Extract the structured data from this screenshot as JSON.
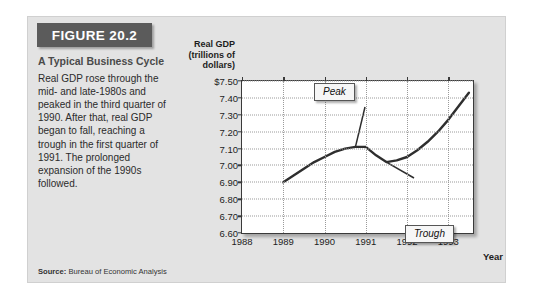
{
  "figure": {
    "header_label": "FIGURE 20.2",
    "caption_title": "A Typical Business Cycle",
    "caption_body": "Real GDP rose through the mid- and late-1980s and peaked in the third quarter of 1990. After that, real GDP began to fall, reaching a trough in the first quarter of 1991. The prolonged expansion of the 1990s followed.",
    "source_label": "Source:",
    "source_text": " Bureau of Economic Analysis"
  },
  "chart_data": {
    "type": "line",
    "title": "",
    "ylabel": "Real GDP (trillions of dollars)",
    "ylabel_lines": [
      "Real GDP",
      "(trillions of",
      "dollars)"
    ],
    "xlabel": "Year",
    "ylim": [
      6.6,
      7.5
    ],
    "xlim": [
      1988,
      1993.6
    ],
    "grid": true,
    "legend": "none",
    "ytick_labels": [
      "$7.50",
      "7.40",
      "7.30",
      "7.20",
      "7.10",
      "7.00",
      "6.90",
      "6.80",
      "6.70",
      "6.60"
    ],
    "ytick_values": [
      7.5,
      7.4,
      7.3,
      7.2,
      7.1,
      7.0,
      6.9,
      6.8,
      6.7,
      6.6
    ],
    "xtick_labels": [
      "1988",
      "1989",
      "1990",
      "1991",
      "1992",
      "1993"
    ],
    "xtick_values": [
      1988,
      1989,
      1990,
      1991,
      1992,
      1993
    ],
    "series": [
      {
        "name": "Real GDP",
        "color": "#2e2e2e",
        "x": [
          1989.0,
          1989.25,
          1989.5,
          1989.75,
          1990.0,
          1990.25,
          1990.5,
          1990.75,
          1991.0,
          1991.25,
          1991.5,
          1991.75,
          1992.0,
          1992.25,
          1992.5,
          1992.75,
          1993.0,
          1993.25,
          1993.5
        ],
        "y": [
          6.9,
          6.94,
          6.98,
          7.02,
          7.05,
          7.08,
          7.1,
          7.11,
          7.11,
          7.06,
          7.02,
          7.03,
          7.05,
          7.09,
          7.14,
          7.2,
          7.27,
          7.35,
          7.43
        ]
      }
    ],
    "annotations": [
      {
        "label": "Peak",
        "x": 1990.75,
        "y": 7.11
      },
      {
        "label": "Trough",
        "x": 1991.5,
        "y": 7.02
      }
    ]
  }
}
